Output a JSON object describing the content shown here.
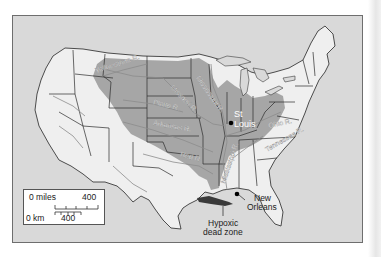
{
  "map": {
    "title": "Mississippi River basin",
    "colors": {
      "ocean": "#d9d9d9",
      "land": "#efefef",
      "basin": "#a6a6a6",
      "state_border": "#2b2b2b",
      "river": "#8c8c8c",
      "dead_zone": "#3a3a3a",
      "frame": "#6e6e6e"
    },
    "rivers": [
      {
        "name": "Yellowstone R.",
        "label": "Yellowstone R."
      },
      {
        "name": "Missouri R.",
        "label": "Missouri R."
      },
      {
        "name": "Mississippi R. (upper)",
        "label": "Mississippi R."
      },
      {
        "name": "Platte R.",
        "label": "Platte R."
      },
      {
        "name": "Arkansas R.",
        "label": "Arkansas R."
      },
      {
        "name": "Red R.",
        "label": "Red R."
      },
      {
        "name": "Ohio R.",
        "label": "Ohio R."
      },
      {
        "name": "Tennessee R.",
        "label": "Tennessee R."
      },
      {
        "name": "Mississippi R. (lower)",
        "label": "Mississippi R."
      }
    ],
    "cities": [
      {
        "name": "St. Louis",
        "label_line1": "St",
        "label_line2": "Louis"
      },
      {
        "name": "New Orleans",
        "label_line1": "New",
        "label_line2": "Orleans"
      }
    ],
    "callouts": {
      "dead_zone_line1": "Hypoxic",
      "dead_zone_line2": "dead zone"
    },
    "scale": {
      "miles_zero": "0 miles",
      "miles_max": "400",
      "km_zero": "0 km",
      "km_max": "400"
    }
  }
}
